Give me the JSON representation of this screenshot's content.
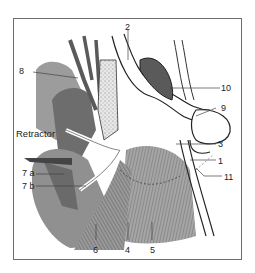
{
  "figure": {
    "type": "anatomical-illustration",
    "labels": [
      {
        "id": "1",
        "text": "1"
      },
      {
        "id": "2",
        "text": "2"
      },
      {
        "id": "3",
        "text": "3"
      },
      {
        "id": "4",
        "text": "4"
      },
      {
        "id": "5",
        "text": "5"
      },
      {
        "id": "6",
        "text": "6"
      },
      {
        "id": "7a",
        "text": "7 a"
      },
      {
        "id": "7b",
        "text": "7 b"
      },
      {
        "id": "8",
        "text": "8"
      },
      {
        "id": "9",
        "text": "9"
      },
      {
        "id": "10",
        "text": "10"
      },
      {
        "id": "11",
        "text": "11"
      }
    ],
    "retractor_label": "Retractor"
  },
  "colors": {
    "frame": "#6e6e6e",
    "gland_dark": "#6d6d6d",
    "gland_mid": "#8e8e8e",
    "gland_light": "#b3b3b3",
    "muscle": "#7a7a7a",
    "ink": "#222222"
  }
}
